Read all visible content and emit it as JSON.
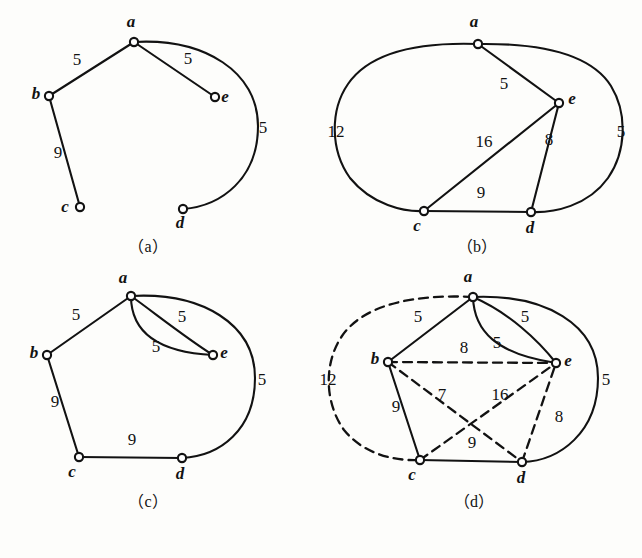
{
  "figure": {
    "background": "#fdfdfb",
    "ink": "#121212",
    "width": 642,
    "height": 558
  },
  "panels": [
    {
      "id": "a",
      "caption": "（a）",
      "caption_pos": [
        148,
        252
      ],
      "nodes": [
        {
          "name": "a",
          "x": 134,
          "y": 42,
          "label": "a",
          "label_x": 131,
          "label_y": 27
        },
        {
          "name": "b",
          "x": 49,
          "y": 96,
          "label": "b",
          "label_x": 36,
          "label_y": 99
        },
        {
          "name": "c",
          "x": 80,
          "y": 207,
          "label": "c",
          "label_x": 65,
          "label_y": 212
        },
        {
          "name": "d",
          "x": 183,
          "y": 209,
          "label": "d",
          "label_x": 180,
          "label_y": 228
        },
        {
          "name": "e",
          "x": 215,
          "y": 97,
          "label": "e",
          "label_x": 225,
          "label_y": 102
        }
      ],
      "edges": [
        {
          "name": "edge-a-b",
          "from": "a",
          "to": "b",
          "style": "solid",
          "kind": "line",
          "weight": "5",
          "label_x": 77,
          "label_y": 65
        },
        {
          "name": "edge-a-e",
          "from": "a",
          "to": "e",
          "style": "solid",
          "kind": "line",
          "weight": "5",
          "label_x": 188,
          "label_y": 64
        },
        {
          "name": "edge-b-c",
          "from": "b",
          "to": "c",
          "style": "solid",
          "kind": "line",
          "weight": "9",
          "label_x": 58,
          "label_y": 158
        },
        {
          "name": "edge-a-d-curve",
          "from": "a",
          "to": "d",
          "style": "solid",
          "kind": "arc",
          "path": "M 134 42 C 205 38 258 72 258 126 C 258 178 222 206 183 209",
          "weight": "5",
          "label_x": 263,
          "label_y": 133
        }
      ]
    },
    {
      "id": "b",
      "caption": "（b）",
      "caption_pos": [
        477,
        252
      ],
      "nodes": [
        {
          "name": "a",
          "x": 478,
          "y": 44,
          "label": "a",
          "label_x": 474,
          "label_y": 27
        },
        {
          "name": "c",
          "x": 424,
          "y": 211,
          "label": "c",
          "label_x": 417,
          "label_y": 231
        },
        {
          "name": "d",
          "x": 531,
          "y": 212,
          "label": "d",
          "label_x": 530,
          "label_y": 233
        },
        {
          "name": "e",
          "x": 559,
          "y": 103,
          "label": "e",
          "label_x": 572,
          "label_y": 104
        }
      ],
      "edges": [
        {
          "name": "edge-a-e",
          "from": "a",
          "to": "e",
          "style": "solid",
          "kind": "line",
          "weight": "5",
          "label_x": 504,
          "label_y": 89
        },
        {
          "name": "edge-e-c",
          "from": "e",
          "to": "c",
          "style": "solid",
          "kind": "line",
          "weight": "16",
          "label_x": 484,
          "label_y": 147
        },
        {
          "name": "edge-e-d",
          "from": "e",
          "to": "d",
          "style": "solid",
          "kind": "line",
          "weight": "8",
          "label_x": 549,
          "label_y": 145
        },
        {
          "name": "edge-c-d",
          "from": "c",
          "to": "d",
          "style": "solid",
          "kind": "line",
          "weight": "9",
          "label_x": 481,
          "label_y": 198
        },
        {
          "name": "edge-a-c-outer",
          "from": "a",
          "to": "c",
          "style": "solid",
          "kind": "arc",
          "path": "M 478 44 C 420 42 370 52 348 84 C 330 110 330 150 350 178 C 372 205 404 212 424 211",
          "weight": "12",
          "label_x": 336,
          "label_y": 137
        },
        {
          "name": "edge-a-d-outer",
          "from": "a",
          "to": "d",
          "style": "solid",
          "kind": "arc",
          "path": "M 478 44 C 545 43 592 56 611 86 C 628 114 626 152 608 178 C 588 206 554 213 531 212",
          "weight": "5",
          "label_x": 621,
          "label_y": 137
        }
      ]
    },
    {
      "id": "c",
      "caption": "（c）",
      "caption_pos": [
        148,
        507
      ],
      "nodes": [
        {
          "name": "a",
          "x": 131,
          "y": 296,
          "label": "a",
          "label_x": 123,
          "label_y": 283
        },
        {
          "name": "b",
          "x": 47,
          "y": 355,
          "label": "b",
          "label_x": 34,
          "label_y": 358
        },
        {
          "name": "c",
          "x": 79,
          "y": 457,
          "label": "c",
          "label_x": 72,
          "label_y": 477
        },
        {
          "name": "d",
          "x": 182,
          "y": 458,
          "label": "d",
          "label_x": 180,
          "label_y": 479
        },
        {
          "name": "e",
          "x": 213,
          "y": 355,
          "label": "e",
          "label_x": 224,
          "label_y": 358
        }
      ],
      "edges": [
        {
          "name": "edge-a-b",
          "from": "a",
          "to": "b",
          "style": "solid",
          "kind": "line",
          "weight": "5",
          "label_x": 76,
          "label_y": 320
        },
        {
          "name": "edge-b-c",
          "from": "b",
          "to": "c",
          "style": "solid",
          "kind": "line",
          "weight": "9",
          "label_x": 55,
          "label_y": 407
        },
        {
          "name": "edge-c-d",
          "from": "c",
          "to": "d",
          "style": "solid",
          "kind": "line",
          "weight": "9",
          "label_x": 132,
          "label_y": 445
        },
        {
          "name": "edge-a-e-upper",
          "from": "a",
          "to": "e",
          "style": "solid",
          "kind": "arc",
          "path": "M 131 296 C 156 314 186 338 213 355",
          "weight": "5",
          "label_x": 182,
          "label_y": 322
        },
        {
          "name": "edge-a-e-lower",
          "from": "a",
          "to": "e",
          "style": "solid",
          "kind": "arc",
          "path": "M 131 296 C 131 330 154 352 213 355",
          "weight": "5",
          "label_x": 156,
          "label_y": 352
        },
        {
          "name": "edge-a-d-outer",
          "from": "a",
          "to": "d",
          "style": "solid",
          "kind": "arc",
          "path": "M 131 296 C 202 292 255 324 255 378 C 255 430 220 456 182 458",
          "weight": "5",
          "label_x": 262,
          "label_y": 385
        }
      ]
    },
    {
      "id": "d",
      "caption": "（d）",
      "caption_pos": [
        474,
        507
      ],
      "nodes": [
        {
          "name": "a",
          "x": 473,
          "y": 297,
          "label": "a",
          "label_x": 468,
          "label_y": 282
        },
        {
          "name": "b",
          "x": 388,
          "y": 362,
          "label": "b",
          "label_x": 375,
          "label_y": 364
        },
        {
          "name": "c",
          "x": 420,
          "y": 460,
          "label": "c",
          "label_x": 412,
          "label_y": 480
        },
        {
          "name": "d",
          "x": 522,
          "y": 462,
          "label": "d",
          "label_x": 521,
          "label_y": 483
        },
        {
          "name": "e",
          "x": 556,
          "y": 363,
          "label": "e",
          "label_x": 568,
          "label_y": 366
        }
      ],
      "edges": [
        {
          "name": "edge-a-b",
          "from": "a",
          "to": "b",
          "style": "solid",
          "kind": "line",
          "weight": "5",
          "label_x": 418,
          "label_y": 322
        },
        {
          "name": "edge-b-c",
          "from": "b",
          "to": "c",
          "style": "solid",
          "kind": "line",
          "weight": "9",
          "label_x": 396,
          "label_y": 412
        },
        {
          "name": "edge-c-d",
          "from": "c",
          "to": "d",
          "style": "solid",
          "kind": "line",
          "weight": "9",
          "label_x": 472,
          "label_y": 448
        },
        {
          "name": "edge-a-e-upper",
          "from": "a",
          "to": "e",
          "style": "solid",
          "kind": "arc",
          "path": "M 473 297 C 508 312 538 340 556 363",
          "weight": "5",
          "label_x": 525,
          "label_y": 322
        },
        {
          "name": "edge-a-e-lower",
          "from": "a",
          "to": "e",
          "style": "solid",
          "kind": "arc",
          "path": "M 473 297 C 474 331 496 354 556 363",
          "weight": "5",
          "label_x": 497,
          "label_y": 348
        },
        {
          "name": "edge-a-d-outer",
          "from": "a",
          "to": "d",
          "style": "solid",
          "kind": "arc",
          "path": "M 473 297 C 545 294 598 324 598 378 C 598 432 560 461 522 462",
          "weight": "5",
          "label_x": 606,
          "label_y": 385
        },
        {
          "name": "edge-b-e-dashed",
          "from": "b",
          "to": "e",
          "style": "dashed",
          "kind": "line",
          "weight": "8",
          "label_x": 464,
          "label_y": 353
        },
        {
          "name": "edge-b-d-dashed",
          "from": "b",
          "to": "d",
          "style": "dashed",
          "kind": "line",
          "weight": "7",
          "label_x": 442,
          "label_y": 400
        },
        {
          "name": "edge-c-e-dashed",
          "from": "c",
          "to": "e",
          "style": "dashed",
          "kind": "line",
          "weight": "16",
          "label_x": 500,
          "label_y": 400
        },
        {
          "name": "edge-d-e-dashed",
          "from": "d",
          "to": "e",
          "style": "dashed",
          "kind": "line",
          "weight": "8",
          "label_x": 559,
          "label_y": 422
        },
        {
          "name": "edge-a-c-outer-dashed",
          "from": "a",
          "to": "c",
          "style": "dashed",
          "kind": "arc",
          "path": "M 473 297 C 415 294 364 304 342 336 C 324 362 324 402 344 430 C 366 457 400 461 420 460",
          "weight": "12",
          "label_x": 328,
          "label_y": 385
        }
      ]
    }
  ]
}
